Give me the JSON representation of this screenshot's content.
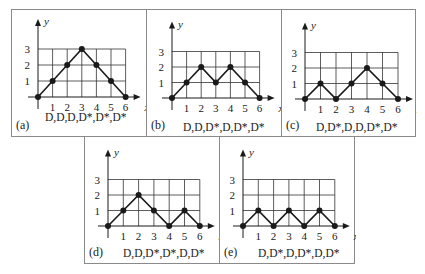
{
  "chart_data": [
    {
      "type": "line",
      "panel": "(a)",
      "caption": "D,D,D,D*,D*,D*",
      "x": [
        0,
        1,
        2,
        3,
        4,
        5,
        6
      ],
      "values": [
        0,
        1,
        2,
        3,
        2,
        1,
        0
      ],
      "xlabel": "x",
      "ylabel": "y",
      "xticks": [
        "1",
        "2",
        "3",
        "4",
        "5",
        "6"
      ],
      "yticks": [
        "1",
        "2",
        "3"
      ],
      "xlim": [
        0,
        6
      ],
      "ylim": [
        0,
        3
      ],
      "grid": true
    },
    {
      "type": "line",
      "panel": "(b)",
      "caption": "D,D,D*,D,D*,D*",
      "x": [
        0,
        1,
        2,
        3,
        4,
        5,
        6
      ],
      "values": [
        0,
        1,
        2,
        1,
        2,
        1,
        0
      ],
      "xlabel": "x",
      "ylabel": "y",
      "xticks": [
        "1",
        "2",
        "3",
        "4",
        "5",
        "6"
      ],
      "yticks": [
        "1",
        "2",
        "3"
      ],
      "xlim": [
        0,
        6
      ],
      "ylim": [
        0,
        3
      ],
      "grid": true
    },
    {
      "type": "line",
      "panel": "(c)",
      "caption": "D,D*,D,D,D*,D*",
      "x": [
        0,
        1,
        2,
        3,
        4,
        5,
        6
      ],
      "values": [
        0,
        1,
        0,
        1,
        2,
        1,
        0
      ],
      "xlabel": "x",
      "ylabel": "y",
      "xticks": [
        "1",
        "2",
        "3",
        "4",
        "5",
        "6"
      ],
      "yticks": [
        "1",
        "2",
        "3"
      ],
      "xlim": [
        0,
        6
      ],
      "ylim": [
        0,
        3
      ],
      "grid": true
    },
    {
      "type": "line",
      "panel": "(d)",
      "caption": "D,D,D*,D*,D,D*",
      "x": [
        0,
        1,
        2,
        3,
        4,
        5,
        6
      ],
      "values": [
        0,
        1,
        2,
        1,
        0,
        1,
        0
      ],
      "xlabel": "x",
      "ylabel": "y",
      "xticks": [
        "1",
        "2",
        "3",
        "4",
        "5",
        "6"
      ],
      "yticks": [
        "1",
        "2",
        "3"
      ],
      "xlim": [
        0,
        6
      ],
      "ylim": [
        0,
        3
      ],
      "grid": true
    },
    {
      "type": "line",
      "panel": "(e)",
      "caption": "D,D*,D,D*,D,D*",
      "x": [
        0,
        1,
        2,
        3,
        4,
        5,
        6
      ],
      "values": [
        0,
        1,
        0,
        1,
        0,
        1,
        0
      ],
      "xlabel": "x",
      "ylabel": "y",
      "xticks": [
        "1",
        "2",
        "3",
        "4",
        "5",
        "6"
      ],
      "yticks": [
        "1",
        "2",
        "3"
      ],
      "xlim": [
        0,
        6
      ],
      "ylim": [
        0,
        3
      ],
      "grid": true
    }
  ],
  "colors": {
    "line": "#1a1a1a",
    "grid": "#333333",
    "border": "#8a8a8a"
  }
}
